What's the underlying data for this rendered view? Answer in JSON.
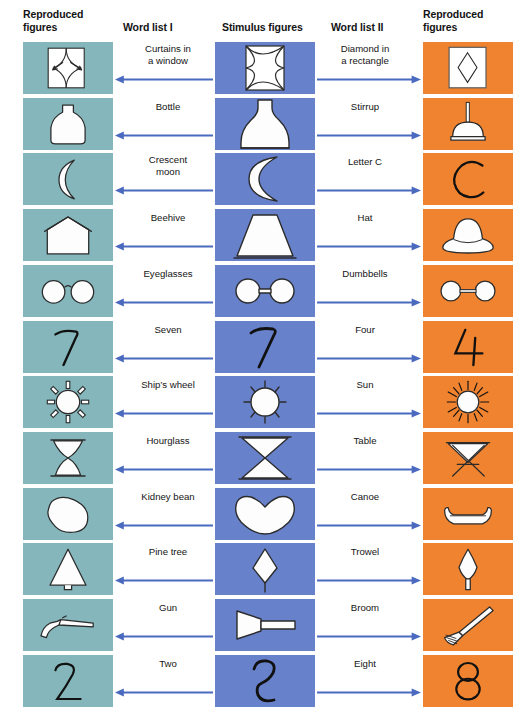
{
  "headers": {
    "left": "Reproduced figures",
    "left_l1": "Reproduced",
    "left_l2": "figures",
    "word_list_1": "Word list I",
    "stimulus": "Stimulus figures",
    "word_list_2": "Word list II",
    "right_l1": "Reproduced",
    "right_l2": "figures"
  },
  "colors": {
    "reproduced_left_bg": "#84b6bb",
    "stimulus_bg": "#6881cb",
    "reproduced_right_bg": "#f0832f",
    "arrow": "#4a6ac0",
    "figure_fill": "#fdfdfd",
    "figure_stroke": "#2b2b2b",
    "text": "#131313"
  },
  "rows": [
    {
      "index": 1,
      "word_list_1": "Curtains in a window",
      "word_list_1_lines": [
        "Curtains in",
        "a window"
      ],
      "stimulus_name": "square-with-concave-star",
      "word_list_2": "Diamond in a rectangle",
      "word_list_2_lines": [
        "Diamond in",
        "a rectangle"
      ],
      "reproduced_left_name": "curtains-in-window-drawing",
      "reproduced_right_name": "diamond-in-rectangle-drawing"
    },
    {
      "index": 2,
      "word_list_1": "Bottle",
      "word_list_1_lines": [
        "Bottle"
      ],
      "stimulus_name": "flask-shape",
      "word_list_2": "Stirrup",
      "word_list_2_lines": [
        "Stirrup"
      ],
      "reproduced_left_name": "bottle-drawing",
      "reproduced_right_name": "stirrup-drawing"
    },
    {
      "index": 3,
      "word_list_1": "Crescent moon",
      "word_list_1_lines": [
        "Crescent",
        "moon"
      ],
      "stimulus_name": "crescent-shape",
      "word_list_2": "Letter C",
      "word_list_2_lines": [
        "Letter C"
      ],
      "reproduced_left_name": "crescent-moon-drawing",
      "reproduced_right_name": "letter-c-drawing"
    },
    {
      "index": 4,
      "word_list_1": "Beehive",
      "word_list_1_lines": [
        "Beehive"
      ],
      "stimulus_name": "trapezoid-shape",
      "word_list_2": "Hat",
      "word_list_2_lines": [
        "Hat"
      ],
      "reproduced_left_name": "beehive-drawing",
      "reproduced_right_name": "hat-drawing"
    },
    {
      "index": 5,
      "word_list_1": "Eyeglasses",
      "word_list_1_lines": [
        "Eyeglasses"
      ],
      "stimulus_name": "two-circles-joined-by-bar",
      "word_list_2": "Dumbbells",
      "word_list_2_lines": [
        "Dumbbells"
      ],
      "reproduced_left_name": "eyeglasses-drawing",
      "reproduced_right_name": "dumbbells-drawing"
    },
    {
      "index": 6,
      "word_list_1": "Seven",
      "word_list_1_lines": [
        "Seven"
      ],
      "stimulus_name": "seven-like-figure",
      "word_list_2": "Four",
      "word_list_2_lines": [
        "Four"
      ],
      "reproduced_left_name": "digit-seven-drawing",
      "reproduced_right_name": "digit-four-drawing"
    },
    {
      "index": 7,
      "word_list_1": "Ship's wheel",
      "word_list_1_lines": [
        "Ship’s wheel"
      ],
      "stimulus_name": "circle-with-rays",
      "word_list_2": "Sun",
      "word_list_2_lines": [
        "Sun"
      ],
      "reproduced_left_name": "ships-wheel-drawing",
      "reproduced_right_name": "sun-drawing"
    },
    {
      "index": 8,
      "word_list_1": "Hourglass",
      "word_list_1_lines": [
        "Hourglass"
      ],
      "stimulus_name": "two-triangles-bowtie",
      "word_list_2": "Table",
      "word_list_2_lines": [
        "Table"
      ],
      "reproduced_left_name": "hourglass-drawing",
      "reproduced_right_name": "table-drawing"
    },
    {
      "index": 9,
      "word_list_1": "Kidney bean",
      "word_list_1_lines": [
        "Kidney bean"
      ],
      "stimulus_name": "curved-bean-shape",
      "word_list_2": "Canoe",
      "word_list_2_lines": [
        "Canoe"
      ],
      "reproduced_left_name": "kidney-bean-drawing",
      "reproduced_right_name": "canoe-drawing"
    },
    {
      "index": 10,
      "word_list_1": "Pine tree",
      "word_list_1_lines": [
        "Pine tree"
      ],
      "stimulus_name": "diamond-with-stem",
      "word_list_2": "Trowel",
      "word_list_2_lines": [
        "Trowel"
      ],
      "reproduced_left_name": "pine-tree-drawing",
      "reproduced_right_name": "trowel-drawing"
    },
    {
      "index": 11,
      "word_list_1": "Gun",
      "word_list_1_lines": [
        "Gun"
      ],
      "stimulus_name": "cone-with-handle",
      "word_list_2": "Broom",
      "word_list_2_lines": [
        "Broom"
      ],
      "reproduced_left_name": "gun-drawing",
      "reproduced_right_name": "broom-drawing"
    },
    {
      "index": 12,
      "word_list_1": "Two",
      "word_list_1_lines": [
        "Two"
      ],
      "stimulus_name": "two-like-figure",
      "word_list_2": "Eight",
      "word_list_2_lines": [
        "Eight"
      ],
      "reproduced_left_name": "digit-two-drawing",
      "reproduced_right_name": "digit-eight-drawing"
    }
  ]
}
